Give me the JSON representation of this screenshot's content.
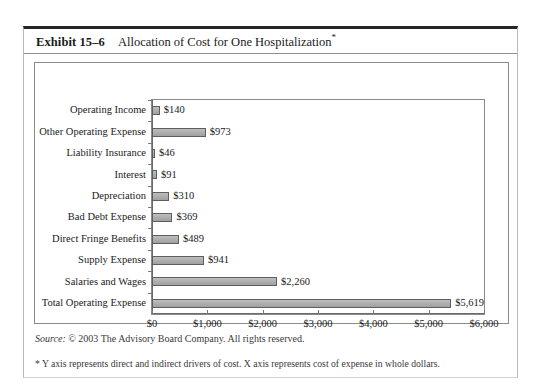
{
  "exhibit": {
    "number": "Exhibit 15–6",
    "caption": "Allocation of Cost for One Hospitalization",
    "caption_marker": "*"
  },
  "footer": {
    "source_label": "Source:",
    "source_text": "© 2003 The Advisory Board Company. All rights reserved.",
    "footnote": "* Y axis represents direct and indirect drivers of cost. X axis represents cost of expense in whole dollars."
  },
  "chart_data": {
    "type": "bar",
    "orientation": "horizontal",
    "title": "Allocation of Cost for One Hospitalization",
    "xlabel": "",
    "ylabel": "",
    "categories": [
      "Operating Income",
      "Other Operating Expense",
      "Liability Insurance",
      "Interest",
      "Depreciation",
      "Bad Debt Expense",
      "Direct Fringe Benefits",
      "Supply Expense",
      "Salaries and Wages",
      "Total Operating Expense"
    ],
    "values": [
      140,
      973,
      46,
      91,
      310,
      369,
      489,
      941,
      2260,
      5619
    ],
    "value_labels": [
      "$140",
      "$973",
      "$46",
      "$91",
      "$310",
      "$369",
      "$489",
      "$941",
      "$2,260",
      "$5,619"
    ],
    "xlim": [
      0,
      6000
    ],
    "xticks": [
      0,
      1000,
      2000,
      3000,
      4000,
      5000,
      6000
    ],
    "xtick_labels": [
      "$0",
      "$1,000",
      "$2,000",
      "$3,000",
      "$4,000",
      "$5,000",
      "$6,000"
    ],
    "grid": false,
    "legend": false,
    "bar_color": "#a9a9a9",
    "bar_border_color": "#5e5e5e"
  }
}
